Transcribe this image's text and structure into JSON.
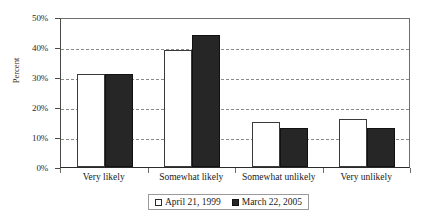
{
  "chart_data": {
    "type": "bar",
    "title": "",
    "subtitle": "",
    "xlabel": "",
    "ylabel": "Percent",
    "ylim": [
      0,
      50
    ],
    "ytick_labels": [
      "0%",
      "10%",
      "20%",
      "30%",
      "40%",
      "50%"
    ],
    "ytick_values": [
      0,
      10,
      20,
      30,
      40,
      50
    ],
    "grid": true,
    "grid_style": "dashed-horizontal",
    "legend_position": "bottom",
    "categories": [
      "Very likely",
      "Somewhat likely",
      "Somewhat unlikely",
      "Very unlikely"
    ],
    "series": [
      {
        "name": "April 21, 1999",
        "color": "#ffffff",
        "edge_color": "#3a3a3a",
        "values": [
          31,
          39,
          15,
          16
        ]
      },
      {
        "name": "March 22, 2005",
        "color": "#262626",
        "edge_color": "#111111",
        "values": [
          31,
          44,
          13,
          13
        ]
      }
    ]
  },
  "axes": {
    "y_title": "Percent"
  },
  "legend": {
    "entries": [
      {
        "label": "April 21, 1999",
        "swatch": "legend-swatch-light"
      },
      {
        "label": "March 22, 2005",
        "swatch": "legend-swatch-dark"
      }
    ]
  }
}
